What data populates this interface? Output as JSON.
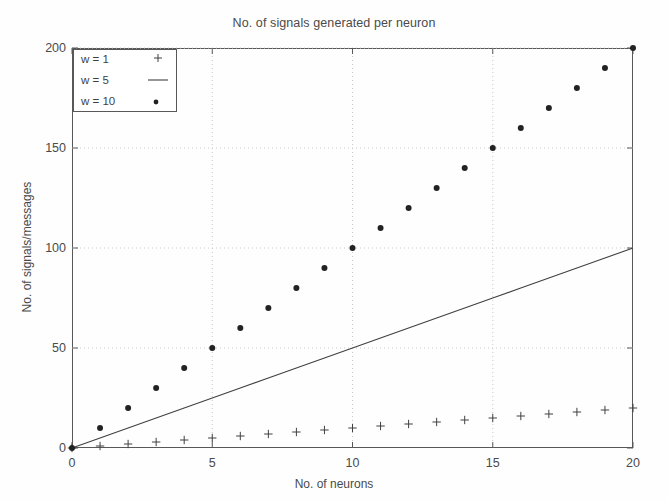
{
  "chart_data": {
    "type": "scatter",
    "title": "No. of signals generated per neuron",
    "xlabel": "No. of neurons",
    "ylabel": "No. of signals/messages",
    "xlim": [
      0,
      20
    ],
    "ylim": [
      0,
      200
    ],
    "xticks": [
      0,
      5,
      10,
      15,
      20
    ],
    "yticks": [
      0,
      50,
      100,
      150,
      200
    ],
    "xticklabels": [
      "0",
      "5",
      "10",
      "15",
      "20"
    ],
    "yticklabels": [
      "0",
      "50",
      "100",
      "150",
      "200"
    ],
    "grid": true,
    "grid_style": "dotted",
    "grid_color": "#c8c8c8",
    "legend_position": "upper left",
    "x": [
      0,
      1,
      2,
      3,
      4,
      5,
      6,
      7,
      8,
      9,
      10,
      11,
      12,
      13,
      14,
      15,
      16,
      17,
      18,
      19,
      20
    ],
    "series": [
      {
        "name": "w = 1",
        "marker": "plus",
        "style": "markers",
        "color": "#404040",
        "values": [
          0,
          1,
          2,
          3,
          4,
          5,
          6,
          7,
          8,
          9,
          10,
          11,
          12,
          13,
          14,
          15,
          16,
          17,
          18,
          19,
          20
        ]
      },
      {
        "name": "w = 5",
        "marker": "none",
        "style": "line",
        "color": "#404040",
        "values": [
          0,
          5,
          10,
          15,
          20,
          25,
          30,
          35,
          40,
          45,
          50,
          55,
          60,
          65,
          70,
          75,
          80,
          85,
          90,
          95,
          100
        ]
      },
      {
        "name": "w = 10",
        "marker": "dot",
        "style": "markers",
        "color": "#222222",
        "values": [
          0,
          10,
          20,
          30,
          40,
          50,
          60,
          70,
          80,
          90,
          100,
          110,
          120,
          130,
          140,
          150,
          160,
          170,
          180,
          190,
          200
        ]
      }
    ]
  },
  "legend": {
    "entries": [
      {
        "label": "w = 1",
        "marker": "plus-marker"
      },
      {
        "label": "w = 5",
        "marker": "line-marker"
      },
      {
        "label": "w = 10",
        "marker": "dot-marker"
      }
    ]
  }
}
